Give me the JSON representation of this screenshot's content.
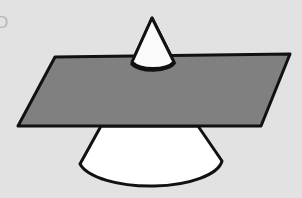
{
  "figure": {
    "title_label": "D",
    "background_color": "#e2e2e2",
    "outline_color": "#111111",
    "plane_fill_color": "#808080",
    "cone_fill_color": "#fbfbfb",
    "canvas": {
      "width": 302,
      "height": 198
    }
  },
  "shapes": {
    "plane": {
      "name": "cutting-plane",
      "fill": "#808080",
      "stroke": "#111111",
      "stroke_width": 3,
      "points": "55,57 290,54 261,126 18,126"
    },
    "cone_upper": {
      "name": "cone-upper-nappe",
      "fill": "#fbfbfb",
      "stroke": "#111111",
      "stroke_width": 3,
      "apex": "152,18",
      "path": "M152,18 L132,62 A23,11 0 0 0 174,62 Z"
    },
    "cone_lower": {
      "name": "cone-lower-body",
      "fill": "#ffffff",
      "stroke": "#111111",
      "stroke_width": 3,
      "path": "M101,126 L80,164 A72,28 0 0 0 222,161 L198,126 Z"
    },
    "plane_top_edge": {
      "name": "plane-top-edge",
      "path": "M55,57 L290,54"
    }
  },
  "legend": {
    "shown": false
  }
}
